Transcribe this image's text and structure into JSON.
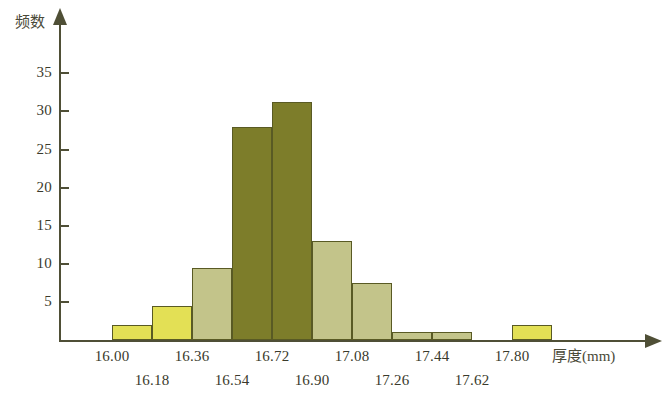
{
  "chart_data": {
    "type": "bar",
    "title": "",
    "subtitle": "",
    "xlabel": "厚度",
    "xunit": "(mm)",
    "ylabel": "频数",
    "grid": false,
    "legend": "none",
    "ylim": [
      0,
      38
    ],
    "xlim": [
      16.0,
      17.98
    ],
    "bin_width": 0.18,
    "y_ticks": [
      5,
      10,
      15,
      20,
      25,
      30,
      35
    ],
    "x_ticks": [
      "16.00",
      "16.18",
      "16.36",
      "16.54",
      "16.72",
      "16.90",
      "17.08",
      "17.26",
      "17.44",
      "17.62",
      "17.80"
    ],
    "categories": [
      "16.00-16.18",
      "16.18-16.36",
      "16.36-16.54",
      "16.54-16.72",
      "16.72-16.90",
      "16.90-17.08",
      "17.08-17.26",
      "17.26-17.44",
      "17.44-17.62",
      "17.62-17.80",
      "17.80-17.98"
    ],
    "values": [
      2,
      4.5,
      9.5,
      28,
      31.3,
      13,
      7.5,
      1,
      1,
      0,
      2
    ],
    "bar_colors": [
      "#e3e055",
      "#e3e055",
      "#c3c48a",
      "#7d7d2a",
      "#7d7d2a",
      "#c3c48a",
      "#c3c48a",
      "#c3c48a",
      "#c3c48a",
      "#ffffff",
      "#e3e055"
    ]
  },
  "colors": {
    "bright_yellow": "#e3e055",
    "light_olive": "#c3c48a",
    "dark_olive": "#7d7d2a",
    "bar_border": "#595a24",
    "axis": "#4f4f36",
    "background": "#ffffff"
  },
  "axis_titles": {
    "y": "频数",
    "x": "厚度",
    "x_unit": "(mm)"
  }
}
